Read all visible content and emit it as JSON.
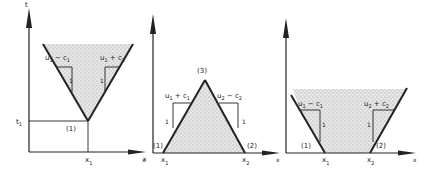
{
  "figure": {
    "panels": [
      {
        "id": "panel-1",
        "axis_labels": {
          "y": "t",
          "x": "x"
        },
        "tick_labels": {
          "t1": "t",
          "t1_sub": "1",
          "x1": "x",
          "x1_sub": "1"
        },
        "region_label": "(1)",
        "characteristic_labels": [
          {
            "main": "u",
            "sub1": "1",
            "op": " − c",
            "sub2": "1"
          },
          {
            "main": "u",
            "sub1": "1",
            "op": " + c",
            "sub2": "1"
          }
        ],
        "slope_unit_labels": [
          "1",
          "1"
        ]
      },
      {
        "id": "panel-2",
        "axis_labels": {
          "x": "x"
        },
        "tick_labels": {
          "x1": "x",
          "x1_sub": "1",
          "x2": "x",
          "x2_sub": "2"
        },
        "region_labels": [
          "(1)",
          "(2)",
          "(3)"
        ],
        "characteristic_labels": [
          {
            "main": "u",
            "sub1": "1",
            "op": " + c",
            "sub2": "1"
          },
          {
            "main": "u",
            "sub1": "2",
            "op": " − c",
            "sub2": "2"
          }
        ],
        "slope_unit_labels": [
          "1",
          "1"
        ]
      },
      {
        "id": "panel-3",
        "axis_labels": {
          "x": "x"
        },
        "tick_labels": {
          "x1": "x",
          "x1_sub": "1",
          "x2": "x",
          "x2_sub": "2"
        },
        "region_labels": [
          "(1)",
          "(2)"
        ],
        "characteristic_labels": [
          {
            "main": "u",
            "sub1": "1",
            "op": " − c",
            "sub2": "1"
          },
          {
            "main": "u",
            "sub1": "2",
            "op": " + c",
            "sub2": "2"
          }
        ],
        "slope_unit_labels": [
          "1",
          "1"
        ]
      }
    ],
    "colors": {
      "ink": "#222222",
      "shade": "#cfcfcf",
      "background": "#ffffff"
    }
  }
}
